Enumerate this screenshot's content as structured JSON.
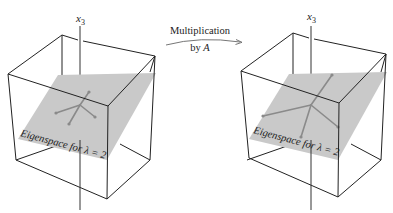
{
  "figure": {
    "left_panel": {
      "axis_label": "x",
      "axis_subscript": "3",
      "plane_label": "Eigenspace for λ = 2"
    },
    "transform": {
      "line1": "Multiplication",
      "line2_prefix": "by ",
      "line2_symbol": "A"
    },
    "right_panel": {
      "axis_label": "x",
      "axis_subscript": "3",
      "plane_label": "Eigenspace for λ = 2"
    },
    "colors": {
      "plane": "#c9c9c9",
      "edges": "#222222",
      "vectors": "#8a8a8a"
    }
  }
}
